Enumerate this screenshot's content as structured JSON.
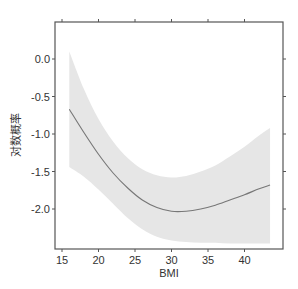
{
  "chart_data": {
    "type": "line",
    "title": "",
    "xlabel": "BMI",
    "ylabel": "对数概率",
    "xlim": [
      14.5,
      44.5
    ],
    "ylim": [
      -2.5,
      0.45
    ],
    "xticks": [
      15,
      20,
      25,
      30,
      35,
      40
    ],
    "yticks": [
      0.0,
      -0.5,
      -1.0,
      -1.5,
      -2.0
    ],
    "xtick_labels": [
      "15",
      "20",
      "25",
      "30",
      "35",
      "40"
    ],
    "ytick_labels": [
      "0.0",
      "-0.5",
      "-1.0",
      "-1.5",
      "-2.0"
    ],
    "grid": false,
    "legend": null,
    "series": [
      {
        "name": "fit",
        "color": "#777777",
        "x": [
          16,
          18,
          20,
          22,
          24,
          26,
          28,
          30,
          32,
          34,
          36,
          38,
          40,
          42,
          43.5
        ],
        "y": [
          -0.67,
          -0.98,
          -1.27,
          -1.52,
          -1.72,
          -1.88,
          -1.98,
          -2.03,
          -2.03,
          -2.0,
          -1.95,
          -1.88,
          -1.81,
          -1.73,
          -1.68
        ]
      },
      {
        "name": "confidence_band",
        "type": "area",
        "color": "#e6e6e6",
        "x": [
          16,
          18,
          20,
          22,
          24,
          26,
          28,
          30,
          32,
          34,
          36,
          38,
          40,
          42,
          43.5
        ],
        "upper": [
          0.1,
          -0.4,
          -0.8,
          -1.1,
          -1.32,
          -1.47,
          -1.55,
          -1.58,
          -1.56,
          -1.5,
          -1.42,
          -1.3,
          -1.17,
          -1.02,
          -0.92
        ],
        "lower": [
          -1.44,
          -1.57,
          -1.74,
          -1.93,
          -2.12,
          -2.27,
          -2.37,
          -2.42,
          -2.44,
          -2.45,
          -2.45,
          -2.46,
          -2.46,
          -2.46,
          -2.46
        ]
      }
    ]
  },
  "plot": {
    "xlabel": "BMI",
    "ylabel": "对数概率"
  }
}
